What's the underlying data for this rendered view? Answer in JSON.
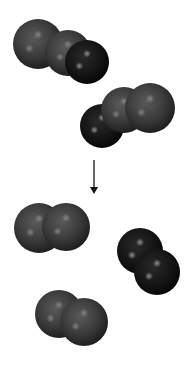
{
  "diagram": {
    "type": "molecular-reaction",
    "colors": {
      "gray_atom": "#3c3c3c",
      "gray_atom_highlight": "#8a8a8a",
      "dark_atom": "#141414",
      "dark_atom_highlight": "#9a9a9a",
      "arrow": "#111111",
      "background": "#ffffff"
    },
    "reactants": [
      {
        "id": "reactant-1",
        "atoms": [
          {
            "kind": "gray",
            "cx": 38,
            "cy": 44,
            "r": 25
          },
          {
            "kind": "gray",
            "cx": 68,
            "cy": 53,
            "r": 23
          },
          {
            "kind": "dark",
            "cx": 87,
            "cy": 62,
            "r": 22
          }
        ]
      },
      {
        "id": "reactant-2",
        "atoms": [
          {
            "kind": "dark",
            "cx": 102,
            "cy": 126,
            "r": 22
          },
          {
            "kind": "gray",
            "cx": 124,
            "cy": 110,
            "r": 23
          },
          {
            "kind": "gray",
            "cx": 150,
            "cy": 108,
            "r": 25
          }
        ]
      }
    ],
    "arrow": {
      "x": 94,
      "y1": 160,
      "y2": 194
    },
    "products": [
      {
        "id": "product-1",
        "atoms": [
          {
            "kind": "gray",
            "cx": 39,
            "cy": 228,
            "r": 25
          },
          {
            "kind": "gray",
            "cx": 66,
            "cy": 227,
            "r": 24
          }
        ]
      },
      {
        "id": "product-2",
        "atoms": [
          {
            "kind": "dark",
            "cx": 140,
            "cy": 251,
            "r": 23
          },
          {
            "kind": "dark",
            "cx": 157,
            "cy": 272,
            "r": 23
          }
        ]
      },
      {
        "id": "product-3",
        "atoms": [
          {
            "kind": "gray",
            "cx": 59,
            "cy": 314,
            "r": 24
          },
          {
            "kind": "gray",
            "cx": 84,
            "cy": 322,
            "r": 24
          }
        ]
      }
    ]
  }
}
